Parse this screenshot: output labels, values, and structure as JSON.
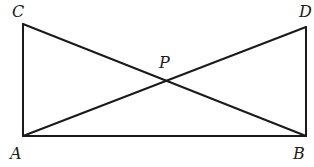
{
  "figure": {
    "points": {
      "A": {
        "label": "A",
        "x": 23,
        "y": 136
      },
      "B": {
        "label": "B",
        "x": 306,
        "y": 136
      },
      "C": {
        "label": "C",
        "x": 23,
        "y": 24
      },
      "D": {
        "label": "D",
        "x": 306,
        "y": 27
      },
      "P": {
        "label": "P",
        "x": 164,
        "y": 81
      }
    },
    "segments": [
      {
        "name": "AC",
        "from": "A",
        "to": "C"
      },
      {
        "name": "BD",
        "from": "B",
        "to": "D"
      },
      {
        "name": "AB",
        "from": "A",
        "to": "B"
      },
      {
        "name": "AD",
        "from": "A",
        "to": "D"
      },
      {
        "name": "BC",
        "from": "B",
        "to": "C"
      }
    ],
    "labels": {
      "A": "A",
      "B": "B",
      "C": "C",
      "D": "D",
      "P": "P"
    },
    "stroke_color": "#1a1a1a",
    "background_color": "#ffffff"
  }
}
